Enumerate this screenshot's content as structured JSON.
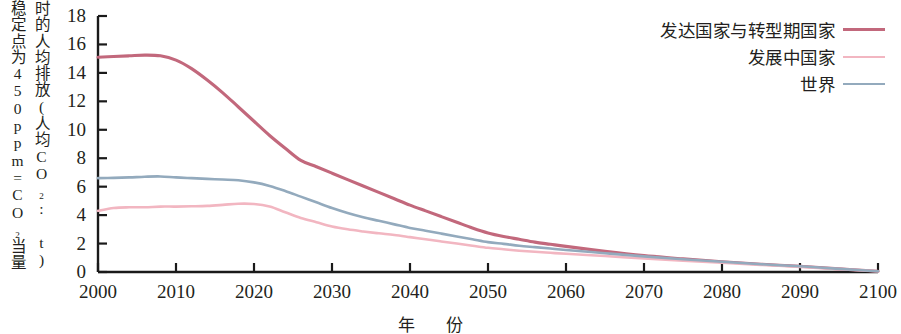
{
  "chart_data": {
    "type": "line",
    "title": "",
    "xlabel": "年　份",
    "ylabel": "稳定点为450ppm=CO2当量时的人均排放(人均CO2: t)",
    "ylabel_line1": "稳定点为450ppm=CO₂当量",
    "ylabel_line2": "时的人均排放(人均CO₂: t)",
    "xlim": [
      2000,
      2100
    ],
    "ylim": [
      0,
      18
    ],
    "xticks": [
      2000,
      2010,
      2020,
      2030,
      2040,
      2050,
      2060,
      2070,
      2080,
      2090,
      2100
    ],
    "xtick_labels": [
      "2000",
      "2010",
      "2020",
      "2030",
      "2040",
      "2050",
      "2060",
      "2070",
      "2080",
      "2090",
      "2100"
    ],
    "yticks": [
      0,
      2,
      4,
      6,
      8,
      10,
      12,
      14,
      16,
      18
    ],
    "ytick_labels": [
      "0",
      "2",
      "4",
      "6",
      "8",
      "10",
      "12",
      "14",
      "16",
      "18"
    ],
    "grid": false,
    "legend_position": "top-right",
    "x": [
      2000,
      2002,
      2004,
      2006,
      2008,
      2010,
      2012,
      2014,
      2016,
      2018,
      2020,
      2022,
      2024,
      2026,
      2028,
      2030,
      2032,
      2034,
      2036,
      2038,
      2040,
      2042,
      2044,
      2046,
      2048,
      2050,
      2052,
      2054,
      2056,
      2058,
      2060,
      2065,
      2070,
      2075,
      2080,
      2085,
      2090,
      2095,
      2100
    ],
    "series": [
      {
        "name": "发达国家与转型期国家",
        "color": "#c2687c",
        "values": [
          15.1,
          15.15,
          15.2,
          15.25,
          15.2,
          14.9,
          14.3,
          13.5,
          12.6,
          11.6,
          10.6,
          9.6,
          8.7,
          7.85,
          7.4,
          6.95,
          6.5,
          6.05,
          5.6,
          5.15,
          4.7,
          4.3,
          3.9,
          3.5,
          3.1,
          2.75,
          2.5,
          2.3,
          2.1,
          1.95,
          1.8,
          1.45,
          1.15,
          0.92,
          0.72,
          0.55,
          0.4,
          0.22,
          0.05
        ]
      },
      {
        "name": "发展中国家",
        "color": "#f2b6c1",
        "values": [
          4.3,
          4.5,
          4.55,
          4.55,
          4.6,
          4.6,
          4.62,
          4.65,
          4.72,
          4.8,
          4.78,
          4.6,
          4.2,
          3.8,
          3.5,
          3.2,
          3.0,
          2.85,
          2.72,
          2.6,
          2.45,
          2.3,
          2.15,
          2.0,
          1.85,
          1.7,
          1.6,
          1.5,
          1.42,
          1.35,
          1.28,
          1.12,
          0.95,
          0.8,
          0.65,
          0.5,
          0.36,
          0.2,
          0.05
        ]
      },
      {
        "name": "世界",
        "color": "#93aabd",
        "values": [
          6.6,
          6.62,
          6.65,
          6.7,
          6.72,
          6.65,
          6.6,
          6.55,
          6.5,
          6.45,
          6.3,
          6.05,
          5.7,
          5.3,
          4.9,
          4.5,
          4.15,
          3.85,
          3.6,
          3.35,
          3.1,
          2.9,
          2.7,
          2.5,
          2.3,
          2.1,
          1.98,
          1.85,
          1.75,
          1.65,
          1.55,
          1.32,
          1.1,
          0.9,
          0.72,
          0.55,
          0.4,
          0.22,
          0.05
        ]
      }
    ]
  },
  "axis": {
    "color": "#1a1a1a"
  }
}
